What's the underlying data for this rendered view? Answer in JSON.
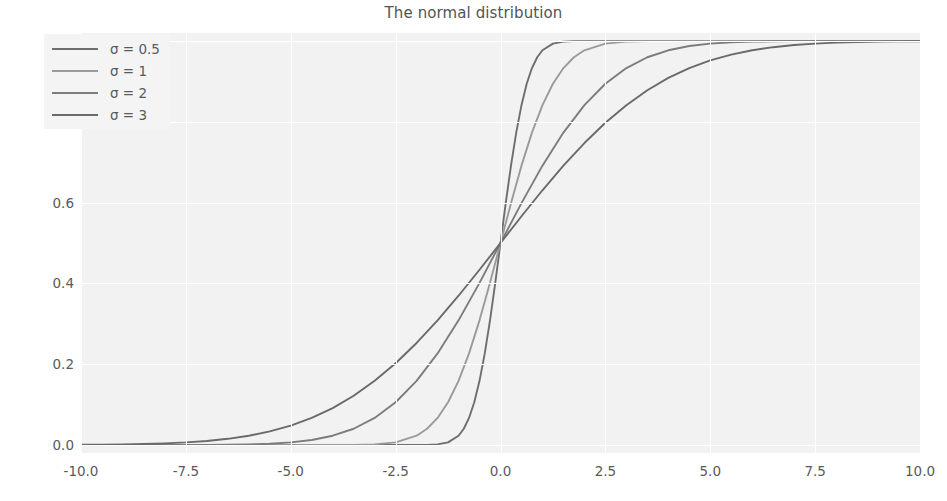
{
  "chart_data": {
    "type": "line",
    "title": "The normal distribution",
    "xlabel": "",
    "ylabel": "",
    "xlim": [
      -10.0,
      10.0
    ],
    "ylim": [
      -0.02,
      1.02
    ],
    "grid": true,
    "grid_color": "#ffffff",
    "axes_facecolor": "#f2f2f2",
    "legend_position": "upper left",
    "xticks": [
      "-10.0",
      "-7.5",
      "-5.0",
      "-2.5",
      "0.0",
      "2.5",
      "5.0",
      "7.5",
      "10.0"
    ],
    "xtick_values": [
      -10.0,
      -7.5,
      -5.0,
      -2.5,
      0.0,
      2.5,
      5.0,
      7.5,
      10.0
    ],
    "yticks": [
      "0.0",
      "0.2",
      "0.4",
      "0.6",
      "0.8",
      "1.0"
    ],
    "ytick_values": [
      0.0,
      0.2,
      0.4,
      0.6,
      0.8,
      1.0
    ],
    "function": "normal cumulative distribution function, mu = 0",
    "series": [
      {
        "name": "σ = 0.5",
        "sigma": 0.5,
        "color": "#6e6e6e",
        "x": [
          -10.0,
          -9.0,
          -8.0,
          -7.0,
          -6.0,
          -5.0,
          -4.0,
          -3.0,
          -2.5,
          -2.0,
          -1.75,
          -1.5,
          -1.25,
          -1.0,
          -0.875,
          -0.75,
          -0.625,
          -0.5,
          -0.375,
          -0.25,
          -0.125,
          0.0,
          0.125,
          0.25,
          0.375,
          0.5,
          0.625,
          0.75,
          0.875,
          1.0,
          1.25,
          1.5,
          1.75,
          2.0,
          2.5,
          3.0,
          4.0,
          5.0,
          6.0,
          7.0,
          8.0,
          9.0,
          10.0
        ],
        "y": [
          0.0,
          0.0,
          0.0,
          0.0,
          0.0,
          0.0,
          0.0,
          0.0,
          0.0,
          0.0,
          0.0002,
          0.0013,
          0.0062,
          0.0228,
          0.0401,
          0.0668,
          0.1056,
          0.1587,
          0.2266,
          0.3085,
          0.4013,
          0.5,
          0.5987,
          0.6915,
          0.7734,
          0.8413,
          0.8944,
          0.9332,
          0.9599,
          0.9772,
          0.9938,
          0.9987,
          0.9998,
          1.0,
          1.0,
          1.0,
          1.0,
          1.0,
          1.0,
          1.0,
          1.0,
          1.0,
          1.0
        ]
      },
      {
        "name": "σ = 1",
        "sigma": 1,
        "color": "#9a9a9a",
        "x": [
          -10.0,
          -9.0,
          -8.0,
          -7.0,
          -6.0,
          -5.0,
          -4.0,
          -3.5,
          -3.0,
          -2.5,
          -2.0,
          -1.75,
          -1.5,
          -1.25,
          -1.0,
          -0.75,
          -0.5,
          -0.25,
          0.0,
          0.25,
          0.5,
          0.75,
          1.0,
          1.25,
          1.5,
          1.75,
          2.0,
          2.5,
          3.0,
          3.5,
          4.0,
          5.0,
          6.0,
          7.0,
          8.0,
          9.0,
          10.0
        ],
        "y": [
          0.0,
          0.0,
          0.0,
          0.0,
          0.0,
          0.0,
          0.0,
          0.0002,
          0.0013,
          0.0062,
          0.0228,
          0.0401,
          0.0668,
          0.1056,
          0.1587,
          0.2266,
          0.3085,
          0.4013,
          0.5,
          0.5987,
          0.6915,
          0.7734,
          0.8413,
          0.8944,
          0.9332,
          0.9599,
          0.9772,
          0.9938,
          0.9987,
          0.9998,
          1.0,
          1.0,
          1.0,
          1.0,
          1.0,
          1.0,
          1.0
        ]
      },
      {
        "name": "σ = 2",
        "sigma": 2,
        "color": "#7c7c7c",
        "x": [
          -10.0,
          -9.0,
          -8.0,
          -7.0,
          -6.5,
          -6.0,
          -5.5,
          -5.0,
          -4.5,
          -4.0,
          -3.5,
          -3.0,
          -2.5,
          -2.0,
          -1.5,
          -1.0,
          -0.5,
          0.0,
          0.5,
          1.0,
          1.5,
          2.0,
          2.5,
          3.0,
          3.5,
          4.0,
          4.5,
          5.0,
          5.5,
          6.0,
          6.5,
          7.0,
          8.0,
          9.0,
          10.0
        ],
        "y": [
          0.0,
          0.0,
          0.0,
          0.0002,
          0.0006,
          0.0013,
          0.003,
          0.0062,
          0.0122,
          0.0228,
          0.0401,
          0.0668,
          0.1056,
          0.1587,
          0.2266,
          0.3085,
          0.4013,
          0.5,
          0.5987,
          0.6915,
          0.7734,
          0.8413,
          0.8944,
          0.9332,
          0.9599,
          0.9772,
          0.9878,
          0.9938,
          0.997,
          0.9987,
          0.9994,
          0.9998,
          1.0,
          1.0,
          1.0
        ]
      },
      {
        "name": "σ = 3",
        "sigma": 3,
        "color": "#6a6a6a",
        "x": [
          -10.0,
          -9.5,
          -9.0,
          -8.5,
          -8.0,
          -7.5,
          -7.0,
          -6.5,
          -6.0,
          -5.5,
          -5.0,
          -4.5,
          -4.0,
          -3.5,
          -3.0,
          -2.5,
          -2.0,
          -1.5,
          -1.0,
          -0.5,
          0.0,
          0.5,
          1.0,
          1.5,
          2.0,
          2.5,
          3.0,
          3.5,
          4.0,
          4.5,
          5.0,
          5.5,
          6.0,
          6.5,
          7.0,
          7.5,
          8.0,
          8.5,
          9.0,
          9.5,
          10.0
        ],
        "y": [
          0.0004,
          0.0008,
          0.0013,
          0.0022,
          0.0038,
          0.0062,
          0.0098,
          0.0151,
          0.0228,
          0.0334,
          0.0478,
          0.0668,
          0.0912,
          0.1217,
          0.1587,
          0.2023,
          0.2525,
          0.3085,
          0.3694,
          0.4338,
          0.5,
          0.5662,
          0.6306,
          0.6915,
          0.7475,
          0.7977,
          0.8413,
          0.8783,
          0.9088,
          0.9332,
          0.9522,
          0.9666,
          0.9772,
          0.9849,
          0.9902,
          0.9938,
          0.9962,
          0.9978,
          0.9987,
          0.9992,
          0.9996
        ]
      }
    ]
  }
}
